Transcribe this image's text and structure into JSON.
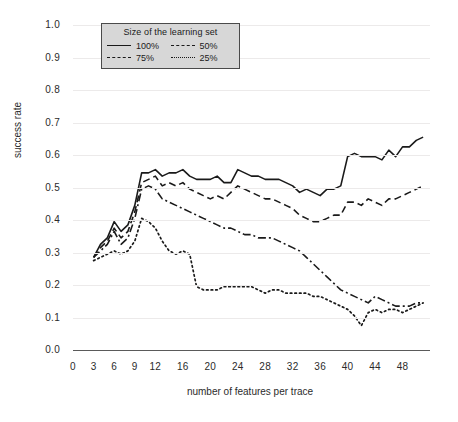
{
  "chart_data": {
    "type": "line",
    "title": "",
    "xlabel": "number of features per trace",
    "ylabel": "success rate",
    "xlim": [
      0,
      52
    ],
    "ylim": [
      0.0,
      1.0
    ],
    "grid": true,
    "legend_position": "top-left-inside",
    "legend_title": "Size of the learning set",
    "xticks": [
      "0",
      "3",
      "6",
      "9",
      "12",
      "16",
      "20",
      "24",
      "28",
      "32",
      "36",
      "40",
      "44",
      "48"
    ],
    "xtick_values": [
      0,
      3,
      6,
      9,
      12,
      16,
      20,
      24,
      28,
      32,
      36,
      40,
      44,
      48
    ],
    "yticks": [
      "0.0",
      "0.1",
      "0.2",
      "0.3",
      "0.4",
      "0.5",
      "0.6",
      "0.7",
      "0.8",
      "0.9",
      "1.0"
    ],
    "ytick_values": [
      0.0,
      0.1,
      0.2,
      0.3,
      0.4,
      0.5,
      0.6,
      0.7,
      0.8,
      0.9,
      1.0
    ],
    "x": [
      3,
      4,
      5,
      6,
      7,
      8,
      9,
      10,
      11,
      12,
      13,
      14,
      15,
      16,
      17,
      18,
      19,
      20,
      21,
      22,
      23,
      24,
      25,
      26,
      27,
      28,
      29,
      30,
      31,
      32,
      33,
      34,
      35,
      36,
      37,
      38,
      39,
      40,
      41,
      42,
      43,
      44,
      45,
      46,
      47,
      48,
      49,
      50,
      51
    ],
    "series": [
      {
        "name": "100%",
        "style": "solid",
        "color": "#1a1a1a",
        "values": [
          0.285,
          0.325,
          0.345,
          0.395,
          0.365,
          0.385,
          0.445,
          0.545,
          0.545,
          0.555,
          0.535,
          0.545,
          0.545,
          0.555,
          0.535,
          0.525,
          0.525,
          0.525,
          0.535,
          0.515,
          0.515,
          0.555,
          0.545,
          0.535,
          0.535,
          0.525,
          0.525,
          0.525,
          0.515,
          0.505,
          0.485,
          0.495,
          0.485,
          0.475,
          0.495,
          0.495,
          0.505,
          0.595,
          0.605,
          0.595,
          0.595,
          0.595,
          0.585,
          0.615,
          0.595,
          0.625,
          0.625,
          0.645,
          0.655
        ]
      },
      {
        "name": "75%",
        "style": "dashed",
        "color": "#1a1a1a",
        "values": [
          0.285,
          0.315,
          0.335,
          0.375,
          0.345,
          0.365,
          0.425,
          0.515,
          0.525,
          0.535,
          0.505,
          0.515,
          0.505,
          0.515,
          0.495,
          0.485,
          0.475,
          0.465,
          0.475,
          0.465,
          0.485,
          0.505,
          0.495,
          0.485,
          0.475,
          0.465,
          0.465,
          0.455,
          0.445,
          0.435,
          0.415,
          0.405,
          0.395,
          0.395,
          0.405,
          0.415,
          0.415,
          0.455,
          0.455,
          0.445,
          0.465,
          0.455,
          0.445,
          0.465,
          0.465,
          0.475,
          0.485,
          0.495,
          0.505
        ]
      },
      {
        "name": "50%",
        "style": "dashdot",
        "color": "#1a1a1a",
        "values": [
          0.285,
          0.305,
          0.325,
          0.365,
          0.325,
          0.345,
          0.405,
          0.495,
          0.505,
          0.495,
          0.465,
          0.455,
          0.445,
          0.435,
          0.425,
          0.415,
          0.405,
          0.395,
          0.385,
          0.375,
          0.375,
          0.365,
          0.355,
          0.355,
          0.345,
          0.345,
          0.345,
          0.335,
          0.325,
          0.315,
          0.305,
          0.285,
          0.265,
          0.245,
          0.225,
          0.205,
          0.185,
          0.175,
          0.165,
          0.155,
          0.145,
          0.165,
          0.155,
          0.145,
          0.135,
          0.135,
          0.135,
          0.145,
          0.145
        ]
      },
      {
        "name": "25%",
        "style": "dotted",
        "color": "#1a1a1a",
        "values": [
          0.275,
          0.285,
          0.295,
          0.305,
          0.295,
          0.305,
          0.335,
          0.405,
          0.395,
          0.375,
          0.335,
          0.305,
          0.295,
          0.305,
          0.295,
          0.195,
          0.185,
          0.185,
          0.185,
          0.195,
          0.195,
          0.195,
          0.195,
          0.195,
          0.185,
          0.175,
          0.185,
          0.185,
          0.175,
          0.175,
          0.175,
          0.175,
          0.165,
          0.165,
          0.155,
          0.145,
          0.135,
          0.125,
          0.105,
          0.075,
          0.115,
          0.125,
          0.115,
          0.125,
          0.125,
          0.115,
          0.125,
          0.135,
          0.145
        ]
      }
    ]
  },
  "legend": {
    "title": "Size of the learning set",
    "entries": [
      {
        "label": "100%",
        "style": "solid"
      },
      {
        "label": "50%",
        "style": "dashdot"
      },
      {
        "label": "75%",
        "style": "dashed"
      },
      {
        "label": "25%",
        "style": "dotted"
      }
    ]
  },
  "axes": {
    "x_title": "number of features per trace",
    "y_title": "success rate"
  }
}
